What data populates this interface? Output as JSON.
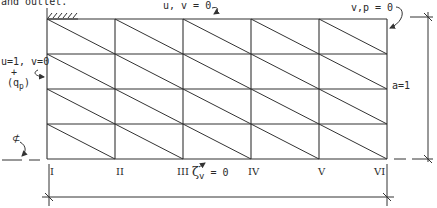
{
  "caption_fragment": "and outlet.",
  "mesh": {
    "columns": 5,
    "rows": 4,
    "x_lines": [
      47,
      115,
      183,
      251,
      319,
      387
    ],
    "y_lines": [
      19,
      54,
      89,
      124,
      159
    ],
    "diagonal_direction": "top-left to bottom-right",
    "line_color": "#333333"
  },
  "boundary_conditions": {
    "top": "u, v = 0",
    "outlet": "v,p = 0",
    "inlet_line1": "u=1, v=0",
    "inlet_line2": "+",
    "inlet_line3": "(q",
    "inlet_sub": "p",
    "inlet_close": ")",
    "bottom_symbol": "ζ",
    "bottom_sub": "v",
    "bottom_rest": " = 0",
    "centerline_symbol": "⊄"
  },
  "section_labels": [
    "I",
    "II",
    "III",
    "IV",
    "V",
    "VI"
  ],
  "dimension": {
    "height_label": "a=1"
  }
}
